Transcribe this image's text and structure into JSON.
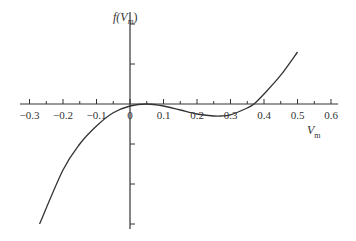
{
  "chart_data": {
    "type": "line",
    "title": "",
    "xlabel": "V_m",
    "ylabel": "f(V_m)",
    "xlim": [
      -0.3,
      0.6
    ],
    "x_ticks": [
      "−0.3",
      "−0.2",
      "−0.1",
      "0",
      "0.1",
      "0.2",
      "0.3",
      "0.4",
      "0.5",
      "0.6"
    ],
    "y_ticks_labeled": false,
    "grid": false,
    "series": [
      {
        "name": "f(V_m)",
        "x": [
          -0.27,
          -0.2,
          -0.15,
          -0.1,
          -0.05,
          0,
          0.05,
          0.1,
          0.15,
          0.2,
          0.25,
          0.27,
          0.3,
          0.35,
          0.37,
          0.4,
          0.45,
          0.5
        ],
        "y": [
          -3.0,
          -1.65,
          -1.0,
          -0.55,
          -0.22,
          -0.05,
          0.0,
          -0.05,
          -0.15,
          -0.25,
          -0.3,
          -0.3,
          -0.27,
          -0.1,
          0.0,
          0.25,
          0.72,
          1.3
        ]
      }
    ]
  },
  "labels": {
    "ylabel_f": "f(",
    "ylabel_v": "V",
    "ylabel_sub": "m",
    "ylabel_close": ")",
    "xlabel_v": "V",
    "xlabel_sub": "m"
  }
}
